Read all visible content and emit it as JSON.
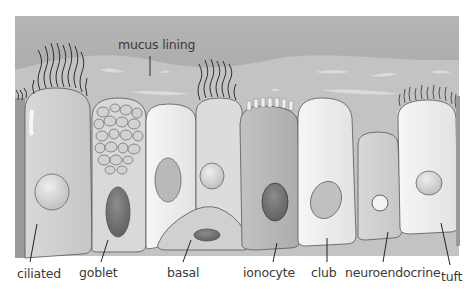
{
  "diagram": {
    "colors": {
      "mucus_top": "#a9a9a9",
      "mucus_mid": "#c4c4c4",
      "cell_light": "#ececec",
      "cell_mid": "#cfcfcf",
      "cell_dark": "#b4b4b4",
      "nucleus_dark": "#7a7a7a",
      "outline": "#555555",
      "cilia": "#333333"
    },
    "labels": {
      "mucus": "mucus lining",
      "ciliated": "ciliated",
      "goblet": "goblet",
      "basal": "basal",
      "ionocyte": "ionocyte",
      "club": "club",
      "neuroendocrine": "neuroendocrine",
      "tuft": "tuft"
    }
  }
}
